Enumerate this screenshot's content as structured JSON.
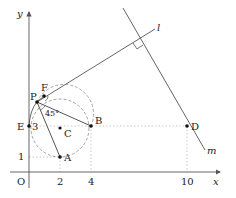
{
  "axes": {
    "x_label": "x",
    "y_label": "y",
    "origin_label": "O",
    "x_ticks": [
      "2",
      "4",
      "10"
    ],
    "y_ticks": [
      "1",
      "3"
    ]
  },
  "points": {
    "A": "A",
    "B": "B",
    "C": "C",
    "D": "D",
    "E": "E",
    "F": "F",
    "P": "P"
  },
  "lines": {
    "l": "l",
    "m": "m"
  },
  "angle_label": "45°",
  "colors": {
    "line": "#555555",
    "dashed": "#999999",
    "dotted": "#bbbbbb",
    "point": "#111111"
  }
}
